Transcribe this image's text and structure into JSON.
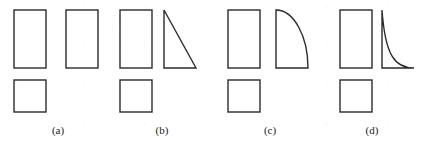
{
  "figure": {
    "background_color": "#ffffff",
    "stroke_color": "#2b2b2b",
    "stroke_width": 1.4,
    "label_color": "#1a1a1a",
    "panels": [
      {
        "id": "a",
        "label": "(a)",
        "label_x": 58,
        "label_y": 125,
        "top_shapes": [
          {
            "name": "rectangle-left",
            "kind": "rectangle",
            "x": 14,
            "y": 10,
            "width": 32,
            "height": 58
          },
          {
            "name": "rectangle-right",
            "kind": "rectangle",
            "x": 66,
            "y": 10,
            "width": 32,
            "height": 58
          }
        ],
        "bottom_shapes": [
          {
            "name": "square-bottom",
            "kind": "square",
            "x": 14,
            "y": 80,
            "width": 32,
            "height": 32
          }
        ]
      },
      {
        "id": "b",
        "label": "(b)",
        "label_x": 162,
        "label_y": 125,
        "top_shapes": [
          {
            "name": "rectangle-left",
            "kind": "rectangle",
            "x": 120,
            "y": 10,
            "width": 32,
            "height": 58
          },
          {
            "name": "triangle-right",
            "kind": "triangle",
            "x": 164,
            "y": 10,
            "width": 32,
            "height": 58
          }
        ],
        "bottom_shapes": [
          {
            "name": "square-bottom",
            "kind": "square",
            "x": 120,
            "y": 80,
            "width": 32,
            "height": 32
          }
        ]
      },
      {
        "id": "c",
        "label": "(c)",
        "label_x": 270,
        "label_y": 125,
        "top_shapes": [
          {
            "name": "rectangle-left",
            "kind": "rectangle",
            "x": 228,
            "y": 10,
            "width": 32,
            "height": 58
          },
          {
            "name": "convex-quarter-ellipse-right",
            "kind": "convex-quarter-ellipse",
            "x": 276,
            "y": 10,
            "width": 32,
            "height": 58
          }
        ],
        "bottom_shapes": [
          {
            "name": "square-bottom",
            "kind": "square",
            "x": 228,
            "y": 80,
            "width": 32,
            "height": 32
          }
        ]
      },
      {
        "id": "d",
        "label": "(d)",
        "label_x": 372,
        "label_y": 125,
        "top_shapes": [
          {
            "name": "rectangle-left",
            "kind": "rectangle",
            "x": 340,
            "y": 10,
            "width": 32,
            "height": 58
          },
          {
            "name": "concave-decay-curve-right",
            "kind": "concave-decay",
            "x": 382,
            "y": 10,
            "width": 32,
            "height": 58
          }
        ],
        "bottom_shapes": [
          {
            "name": "square-bottom",
            "kind": "square",
            "x": 340,
            "y": 80,
            "width": 32,
            "height": 32
          }
        ]
      }
    ]
  }
}
